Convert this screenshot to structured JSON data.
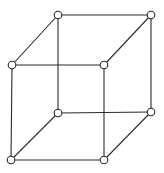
{
  "diagram": {
    "type": "cube-graph",
    "colors": {
      "stroke": "#2a2a2a",
      "node_fill": "#ffffff",
      "background": "#ffffff"
    },
    "node_radius": 3.8,
    "nodes": [
      {
        "id": "back-top-left",
        "x": 58,
        "y": 15
      },
      {
        "id": "back-top-right",
        "x": 151,
        "y": 15
      },
      {
        "id": "back-bottom-left",
        "x": 58,
        "y": 113
      },
      {
        "id": "back-bottom-right",
        "x": 151,
        "y": 112
      },
      {
        "id": "front-top-left",
        "x": 12,
        "y": 65
      },
      {
        "id": "front-top-right",
        "x": 104,
        "y": 65
      },
      {
        "id": "front-bottom-left",
        "x": 11,
        "y": 160
      },
      {
        "id": "front-bottom-right",
        "x": 104,
        "y": 160
      }
    ],
    "edges": [
      [
        "back-top-left",
        "back-top-right"
      ],
      [
        "back-top-left",
        "back-bottom-left"
      ],
      [
        "back-top-right",
        "back-bottom-right"
      ],
      [
        "back-bottom-left",
        "back-bottom-right"
      ],
      [
        "front-top-left",
        "front-top-right"
      ],
      [
        "front-top-left",
        "front-bottom-left"
      ],
      [
        "front-top-right",
        "front-bottom-right"
      ],
      [
        "front-bottom-left",
        "front-bottom-right"
      ],
      [
        "back-top-left",
        "front-top-left"
      ],
      [
        "back-top-right",
        "front-top-right"
      ],
      [
        "back-bottom-left",
        "front-bottom-left"
      ],
      [
        "back-bottom-right",
        "front-bottom-right"
      ]
    ]
  }
}
